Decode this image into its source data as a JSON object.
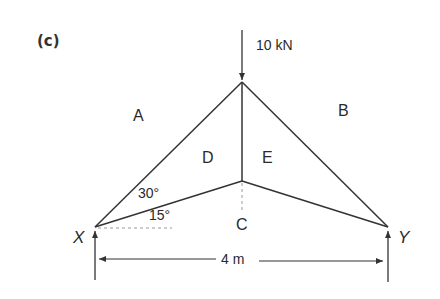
{
  "figure": {
    "label": "(c)",
    "type": "pin-jointed roof truss with Bow's notation"
  },
  "load": {
    "value_label": "10 kN",
    "direction": "downward",
    "applied_at": "apex"
  },
  "spaces": {
    "A": "A",
    "B": "B",
    "C": "C",
    "D": "D",
    "E": "E"
  },
  "supports": {
    "left": "X",
    "right": "Y"
  },
  "angles": {
    "upper": "30°",
    "lower": "15°"
  },
  "dimensions": {
    "span": "4 m"
  },
  "colors": {
    "line": "#333333",
    "dashed": "#9a9a9a",
    "background": "#ffffff"
  }
}
